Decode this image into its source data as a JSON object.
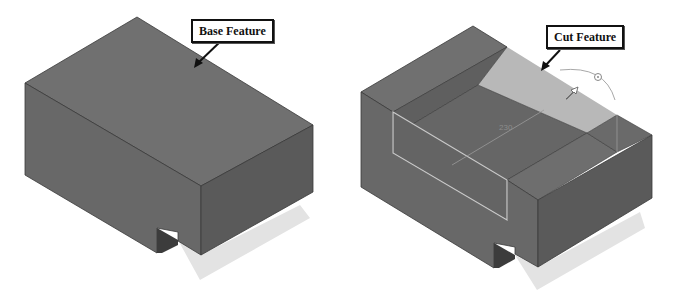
{
  "figure": {
    "left_model": {
      "label": "Base Feature"
    },
    "right_model": {
      "label": "Cut Feature",
      "dimension_text": "230"
    }
  },
  "colors": {
    "background": "#ffffff",
    "top_face": "#6e6e6e",
    "left_face": "#676767",
    "right_face": "#5a5a5a",
    "shadow": "#e3e3e3",
    "highlight_face": "#b9b9b9",
    "edge_highlight": "#c9c9c9"
  }
}
